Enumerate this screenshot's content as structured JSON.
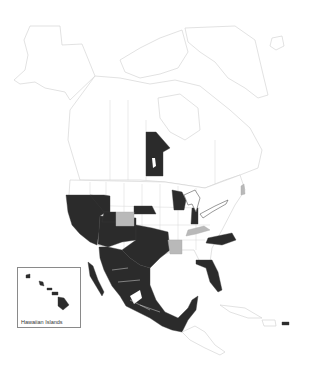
{
  "map": {
    "title": "",
    "region": "North America",
    "colors": {
      "highlight_dark": "#2b2b2b",
      "highlight_gray": "#b9b9b9",
      "background": "#ffffff",
      "outline": "#cfcfcf"
    },
    "dark_regions": [
      "California",
      "Nevada",
      "Oregon",
      "Idaho",
      "Montana",
      "Utah",
      "Arizona",
      "New Mexico",
      "Texas",
      "Oklahoma",
      "Nebraska",
      "Wisconsin",
      "Indiana",
      "North Carolina",
      "Florida",
      "Manitoba",
      "Mexico",
      "Hawaii",
      "Puerto Rico"
    ],
    "gray_regions": [
      "Colorado",
      "Arkansas",
      "Kentucky",
      "New Hampshire"
    ],
    "inset": {
      "label": "Hawaiian Islands"
    }
  }
}
